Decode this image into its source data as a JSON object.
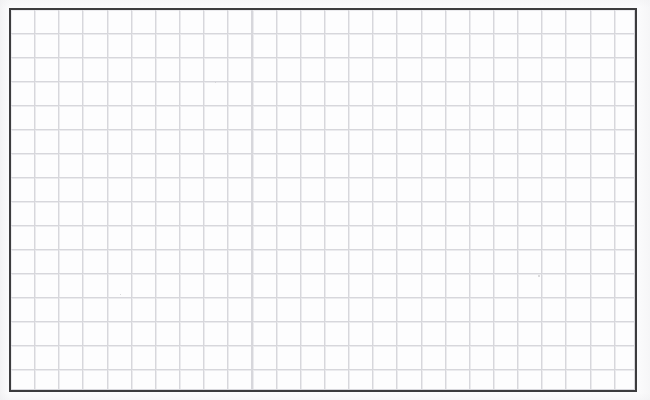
{
  "document": {
    "kind": "grid-paper-scan",
    "title": "Blank grid paper",
    "content_text": "",
    "has_handwriting": false,
    "has_printed_text": false
  },
  "page": {
    "width_px": 650,
    "height_px": 400,
    "background_color": "#fbfbfc",
    "paper_color": "#fdfdfe"
  },
  "frame": {
    "left_px": 9,
    "top_px": 8,
    "width_px": 628,
    "height_px": 384,
    "border_width_px": 2,
    "border_color": "#3c3c3e"
  },
  "grid": {
    "cell_width_px": 24.15,
    "cell_height_px": 24.0,
    "columns": 26,
    "rows": 16,
    "line_color": "#d7d7dc",
    "line_width_px": 1,
    "style": "square-quadrille",
    "major_lines": false
  },
  "specks": [
    {
      "x_px": 536,
      "y_px": 273,
      "size_px": 2
    },
    {
      "x_px": 213,
      "y_px": 80,
      "size_px": 1
    },
    {
      "x_px": 118,
      "y_px": 292,
      "size_px": 1
    }
  ]
}
